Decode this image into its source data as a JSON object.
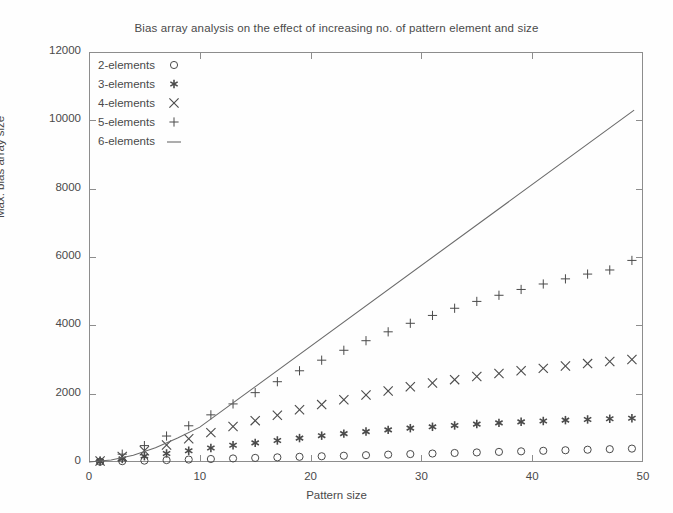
{
  "chart_data": {
    "type": "scatter",
    "title": "Bias array analysis on the effect of increasing no. of pattern element and size",
    "xlabel": "Pattern size",
    "ylabel": "Max. bias array size",
    "xlim": [
      0,
      50
    ],
    "ylim": [
      0,
      12000
    ],
    "xticks": [
      0,
      10,
      20,
      30,
      40,
      50
    ],
    "yticks": [
      0,
      2000,
      4000,
      6000,
      8000,
      10000,
      12000
    ],
    "xtick_labels": [
      "0",
      "10",
      "20",
      "30",
      "40",
      "50"
    ],
    "ytick_labels": [
      "0",
      "2000",
      "4000",
      "6000",
      "8000",
      "10000",
      "12000"
    ],
    "grid": false,
    "legend_position": "top-left",
    "x": [
      1,
      3,
      5,
      7,
      9,
      11,
      13,
      15,
      17,
      19,
      21,
      23,
      25,
      27,
      29,
      31,
      33,
      35,
      37,
      39,
      41,
      43,
      45,
      47,
      49
    ],
    "series": [
      {
        "name": "2-elements",
        "marker": "circle",
        "values": [
          8,
          24,
          40,
          56,
          72,
          88,
          104,
          120,
          136,
          152,
          168,
          184,
          200,
          216,
          232,
          248,
          264,
          280,
          296,
          312,
          328,
          344,
          360,
          376,
          392
        ]
      },
      {
        "name": "3-elements",
        "marker": "asterisk",
        "values": [
          20,
          90,
          170,
          250,
          330,
          410,
          490,
          560,
          630,
          700,
          770,
          830,
          890,
          940,
          990,
          1030,
          1070,
          1110,
          1145,
          1175,
          1200,
          1225,
          1245,
          1265,
          1280
        ]
      },
      {
        "name": "4-elements",
        "marker": "cross",
        "values": [
          30,
          160,
          330,
          500,
          680,
          860,
          1040,
          1210,
          1370,
          1530,
          1680,
          1820,
          1960,
          2080,
          2200,
          2310,
          2410,
          2500,
          2590,
          2670,
          2740,
          2810,
          2880,
          2940,
          3000
        ]
      },
      {
        "name": "5-elements",
        "marker": "plus",
        "values": [
          40,
          230,
          480,
          760,
          1060,
          1380,
          1700,
          2030,
          2350,
          2670,
          2980,
          3270,
          3550,
          3810,
          4060,
          4290,
          4500,
          4700,
          4880,
          5050,
          5210,
          5360,
          5500,
          5620,
          5900
        ]
      },
      {
        "name": "6-elements",
        "marker": "line",
        "line_x": [
          0,
          2,
          4,
          6,
          8,
          10,
          49.2
        ],
        "line_y": [
          0,
          60,
          200,
          420,
          700,
          1020,
          10300
        ]
      }
    ]
  },
  "legend": {
    "items": [
      {
        "label": "2-elements",
        "marker": "circle-marker"
      },
      {
        "label": "3-elements",
        "marker": "asterisk-marker"
      },
      {
        "label": "4-elements",
        "marker": "cross-marker"
      },
      {
        "label": "5-elements",
        "marker": "plus-marker"
      },
      {
        "label": "6-elements",
        "marker": "line-marker"
      }
    ]
  },
  "colors": {
    "axis": "#8d8d8d",
    "text": "#4a4a4a",
    "marker": "#4a4a4a",
    "line": "#6b6b6b",
    "background": "#fefefe"
  }
}
